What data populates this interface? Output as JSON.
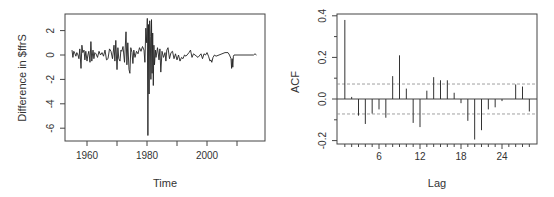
{
  "chart_data": [
    {
      "type": "line",
      "title": "",
      "xlabel": "Time",
      "ylabel": "Difference in $ffrS",
      "xlim": [
        1953,
        2019
      ],
      "ylim": [
        -7,
        3.4
      ],
      "x_ticks": [
        1960,
        1970,
        1980,
        1990,
        2000,
        2010
      ],
      "x_tick_labels": [
        "1960",
        "",
        "1980",
        "",
        "2000",
        ""
      ],
      "y_ticks": [
        -6,
        -4,
        -2,
        0,
        2
      ],
      "y_tick_labels": [
        "-6",
        "-4",
        "-2",
        "0",
        "2"
      ],
      "grid": false,
      "legend": null,
      "series": [
        {
          "name": "diff_ffr",
          "x": [
            1955.0,
            1955.3,
            1955.6,
            1956.0,
            1956.3,
            1956.6,
            1957.0,
            1957.3,
            1957.6,
            1958.0,
            1958.3,
            1958.6,
            1959.0,
            1959.3,
            1959.6,
            1960.0,
            1960.3,
            1960.6,
            1961.0,
            1961.3,
            1961.6,
            1962.0,
            1962.3,
            1962.6,
            1963.0,
            1963.5,
            1964.0,
            1964.5,
            1965.0,
            1965.5,
            1966.0,
            1966.5,
            1967.0,
            1967.5,
            1968.0,
            1968.5,
            1969.0,
            1969.3,
            1969.6,
            1970.0,
            1970.3,
            1970.6,
            1971.0,
            1971.3,
            1971.6,
            1972.0,
            1972.5,
            1973.0,
            1973.3,
            1973.6,
            1974.0,
            1974.3,
            1974.6,
            1975.0,
            1975.3,
            1975.6,
            1976.0,
            1976.5,
            1977.0,
            1977.5,
            1978.0,
            1978.5,
            1979.0,
            1979.3,
            1979.6,
            1979.9,
            1980.1,
            1980.3,
            1980.5,
            1980.7,
            1980.9,
            1981.1,
            1981.3,
            1981.5,
            1981.7,
            1981.9,
            1982.1,
            1982.3,
            1982.5,
            1982.8,
            1983.0,
            1983.5,
            1984.0,
            1984.3,
            1984.6,
            1985.0,
            1985.5,
            1986.0,
            1986.3,
            1986.6,
            1987.0,
            1987.5,
            1988.0,
            1988.5,
            1989.0,
            1989.5,
            1990.0,
            1990.5,
            1991.0,
            1991.5,
            1992.0,
            1992.5,
            1993.0,
            1994.0,
            1994.5,
            1995.0,
            1995.5,
            1996.0,
            1997.0,
            1998.0,
            1998.5,
            1999.0,
            1999.5,
            2000.0,
            2000.5,
            2001.0,
            2001.3,
            2001.6,
            2002.0,
            2002.5,
            2003.0,
            2004.0,
            2005.0,
            2006.0,
            2007.0,
            2007.5,
            2008.0,
            2008.2,
            2008.4,
            2008.6,
            2008.8,
            2009.0,
            2010.0,
            2012.0,
            2014.0,
            2015.5,
            2016.0,
            2016.5
          ],
          "y": [
            0.4,
            -0.2,
            0.3,
            0.1,
            -0.1,
            0.2,
            0.0,
            -0.3,
            0.5,
            -1.1,
            0.8,
            0.2,
            0.4,
            -0.4,
            0.3,
            -0.5,
            0.0,
            0.3,
            -0.6,
            1.1,
            -0.5,
            0.4,
            -0.3,
            0.2,
            0.1,
            -0.2,
            0.3,
            0.0,
            0.2,
            -0.1,
            0.4,
            -0.4,
            -0.3,
            0.5,
            0.3,
            -0.3,
            0.8,
            -0.5,
            1.2,
            -1.2,
            0.6,
            -0.3,
            -0.5,
            0.4,
            0.3,
            0.7,
            -0.6,
            1.9,
            -0.8,
            1.0,
            -1.2,
            -1.5,
            0.6,
            0.2,
            -0.7,
            0.4,
            -0.2,
            0.3,
            0.1,
            0.6,
            0.3,
            0.7,
            0.4,
            -0.6,
            2.2,
            1.0,
            3.0,
            -6.6,
            2.5,
            -3.2,
            2.8,
            1.5,
            -2.0,
            2.9,
            -1.5,
            1.8,
            -2.5,
            0.8,
            -0.8,
            0.4,
            -0.2,
            0.6,
            -0.4,
            0.5,
            -1.4,
            0.3,
            -0.2,
            0.2,
            -0.5,
            0.4,
            0.6,
            -0.3,
            0.2,
            0.3,
            -0.3,
            0.1,
            -0.4,
            0.0,
            -0.5,
            -0.2,
            -0.3,
            0.0,
            -0.1,
            0.2,
            0.4,
            -0.2,
            0.1,
            0.0,
            -0.2,
            0.1,
            -0.3,
            0.1,
            0.0,
            0.2,
            -0.1,
            -0.5,
            -0.4,
            -0.6,
            -0.2,
            0.0,
            -0.1,
            0.0,
            0.1,
            0.2,
            0.2,
            0.0,
            -0.3,
            -1.1,
            -0.3,
            -1.0,
            -0.1,
            0.0,
            0.0,
            0.0,
            0.0,
            0.0,
            0.1,
            0.0
          ]
        }
      ]
    },
    {
      "type": "bar",
      "title": "",
      "xlabel": "Lag",
      "ylabel": "ACF",
      "xlim": [
        0.5,
        29
      ],
      "ylim": [
        -0.2,
        0.4
      ],
      "x_ticks": [
        6,
        12,
        18,
        24
      ],
      "x_tick_labels": [
        "6",
        "12",
        "18",
        "24"
      ],
      "y_ticks": [
        -0.2,
        0.0,
        0.2,
        0.4
      ],
      "y_tick_labels": [
        "-0.2",
        "0.0",
        "0.2",
        "0.4"
      ],
      "confidence_bound": 0.072,
      "grid": false,
      "legend": null,
      "categories": [
        1,
        2,
        3,
        4,
        5,
        6,
        7,
        8,
        9,
        10,
        11,
        12,
        13,
        14,
        15,
        16,
        17,
        18,
        19,
        20,
        21,
        22,
        23,
        24,
        25,
        26,
        27,
        28
      ],
      "values": [
        0.38,
        0.01,
        -0.08,
        -0.12,
        -0.07,
        -0.05,
        -0.09,
        0.11,
        0.21,
        0.05,
        -0.115,
        -0.135,
        0.04,
        0.105,
        0.09,
        0.09,
        0.03,
        -0.02,
        -0.105,
        -0.195,
        -0.15,
        -0.05,
        -0.04,
        -0.01,
        0.0,
        0.07,
        0.06,
        -0.06
      ]
    }
  ],
  "left_plot": {
    "xlabel": "Time",
    "ylabel": "Difference in $ffrS",
    "x_tick_labels": [
      "1960",
      "1980",
      "2000"
    ],
    "y_tick_labels": [
      "-6",
      "-4",
      "-2",
      "0",
      "2"
    ]
  },
  "right_plot": {
    "xlabel": "Lag",
    "ylabel": "ACF",
    "x_tick_labels": [
      "6",
      "12",
      "18",
      "24"
    ],
    "y_tick_labels": [
      "-0.2",
      "0.0",
      "0.2",
      "0.4"
    ]
  },
  "colors": {
    "line": "#222222",
    "axis": "#444444",
    "bound": "#888888",
    "text": "#333333"
  }
}
